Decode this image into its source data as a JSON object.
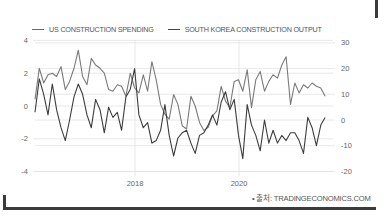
{
  "legend": {
    "us_label": "US CONSTRUCTION SPENDING",
    "kr_label": "SOUTH KOREA CONSTRUCTION OUTPUT"
  },
  "source": "• 출처: TRADINGECONOMICS.COM",
  "colors": {
    "us_line": "#7a7a7a",
    "kr_line": "#3c3c3c",
    "grid": "#e2e2e2",
    "frame": "#3a3a3a"
  },
  "chart_data": {
    "type": "line",
    "title": "",
    "xlabel": "",
    "ylabel_left": "US Construction Spending (%)",
    "ylabel_right": "South Korea Construction Output (%)",
    "x_tick_labels": [
      "2018",
      "2020"
    ],
    "y_left_ticks": [
      "4",
      "2",
      "0",
      "-2",
      "-4"
    ],
    "y_right_ticks": [
      "30",
      "20",
      "10",
      "0",
      "-10",
      "-20"
    ],
    "ylim_left": [
      -4,
      4
    ],
    "ylim_right": [
      -20,
      30
    ],
    "grid": true,
    "legend_position": "top-left",
    "x_start": "2016-03",
    "x_step": "month",
    "series": [
      {
        "name": "US CONSTRUCTION SPENDING",
        "axis": "left",
        "values": [
          0.4,
          2.3,
          1.4,
          1.9,
          2.0,
          1.8,
          2.4,
          1.0,
          1.5,
          2.3,
          3.4,
          1.8,
          1.3,
          2.9,
          2.5,
          2.3,
          2.0,
          1.0,
          0.9,
          1.3,
          1.2,
          0.6,
          2.0,
          1.1,
          0.8,
          1.9,
          0.9,
          2.7,
          1.6,
          0.1,
          -0.5,
          -0.8,
          0.7,
          0.1,
          -1.2,
          -1.4,
          0.6,
          0.0,
          -1.0,
          -1.5,
          -1.3,
          -0.6,
          -0.3,
          1.2,
          0.3,
          -0.1,
          1.5,
          1.6,
          0.9,
          2.2,
          -0.1,
          1.6,
          2.1,
          0.9,
          1.5,
          1.9,
          1.7,
          2.5,
          3.0,
          0.1,
          1.4,
          0.8,
          1.3,
          1.1,
          1.4,
          1.2,
          1.1,
          0.6
        ]
      },
      {
        "name": "SOUTH KOREA CONSTRUCTION OUTPUT",
        "axis": "right",
        "values": [
          3,
          16,
          10,
          2,
          14,
          4,
          -3,
          -8,
          0,
          9,
          14,
          10,
          2,
          -3,
          8,
          4,
          -5,
          5,
          1,
          3,
          -4,
          9,
          12,
          20,
          2,
          -3,
          -1,
          -9,
          -8,
          -4,
          6,
          -6,
          -14,
          -7,
          -5,
          -4,
          -9,
          -13,
          -6,
          -5,
          -2,
          2,
          -2,
          7,
          11,
          4,
          8,
          -6,
          -15,
          6,
          -2,
          -6,
          -12,
          0,
          -9,
          -4,
          -9,
          -6,
          -8,
          -5,
          -5,
          -8,
          -13,
          1,
          -3,
          -10,
          -2,
          1
        ]
      }
    ]
  }
}
